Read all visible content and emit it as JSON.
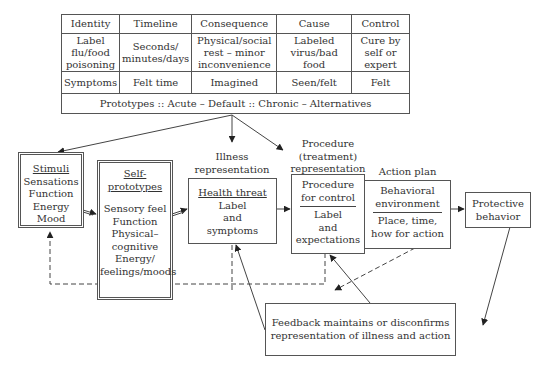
{
  "table": {
    "headers": [
      "Identity",
      "Timeline",
      "Consequence",
      "Cause",
      "Control"
    ],
    "rows": [
      [
        "Label flu/food poisoning",
        "Seconds/ minutes/days",
        "Physical/social rest – minor inconvenience",
        "Labeled virus/bad food",
        "Cure by self or expert"
      ],
      [
        "Symptoms",
        "Felt time",
        "Imagined",
        "Seen/felt",
        "Felt"
      ]
    ],
    "prototypes": "Prototypes :: Acute – Default :: Chronic – Alternatives"
  },
  "boxes": {
    "stimuli": {
      "title": "Stimuli",
      "items": [
        "Sensations",
        "Function",
        "Energy",
        "Mood"
      ]
    },
    "self_prototypes": {
      "title": "Self-prototypes",
      "items": [
        "Sensory feel",
        "Function",
        "Physical–",
        "cognitive",
        "Energy/",
        "feelings/moods"
      ]
    },
    "illness": {
      "caption": [
        "Illness",
        "representation"
      ],
      "title": "Health threat",
      "items": [
        "Label",
        "and",
        "symptoms"
      ]
    },
    "procedure": {
      "caption": [
        "Procedure",
        "(treatment)",
        "representation"
      ],
      "title": [
        "Procedure",
        "for control"
      ],
      "items": [
        "Label",
        "and",
        "expectations"
      ]
    },
    "action_plan": {
      "caption": "Action plan",
      "top": [
        "Behavioral",
        "environment"
      ],
      "bottom": [
        "Place, time,",
        "how for action"
      ]
    },
    "protective": {
      "lines": [
        "Protective",
        "behavior"
      ]
    },
    "feedback": {
      "lines": [
        "Feedback maintains or disconfirms",
        "representation of illness and action"
      ]
    }
  },
  "colors": {
    "line": "#444444",
    "border": "#555555",
    "text": "#333333"
  }
}
